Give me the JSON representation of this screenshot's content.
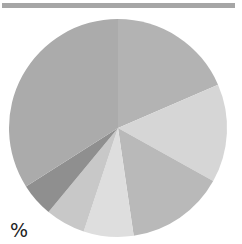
{
  "chart_data": {
    "type": "pie",
    "title": "",
    "unit_label": "%",
    "start_angle_deg": 0,
    "direction": "clockwise",
    "legend": "none",
    "slices": [
      {
        "label": "",
        "value": 18.5,
        "color": "#b3b3b3"
      },
      {
        "label": "",
        "value": 14.6,
        "color": "#d6d6d6"
      },
      {
        "label": "",
        "value": 14.6,
        "color": "#b9b9b9"
      },
      {
        "label": "",
        "value": 7.4,
        "color": "#dedede"
      },
      {
        "label": "",
        "value": 5.9,
        "color": "#c8c8c8"
      },
      {
        "label": "",
        "value": 5.0,
        "color": "#8f8f8f"
      },
      {
        "label": "",
        "value": 34.0,
        "color": "#ababab"
      }
    ],
    "values": [
      18.5,
      14.6,
      14.6,
      7.4,
      5.9,
      5.0,
      34.0
    ]
  },
  "header": {
    "bar_color": "#a6a6a6"
  },
  "geometry": {
    "cx": 118,
    "cy": 128,
    "r": 109
  }
}
